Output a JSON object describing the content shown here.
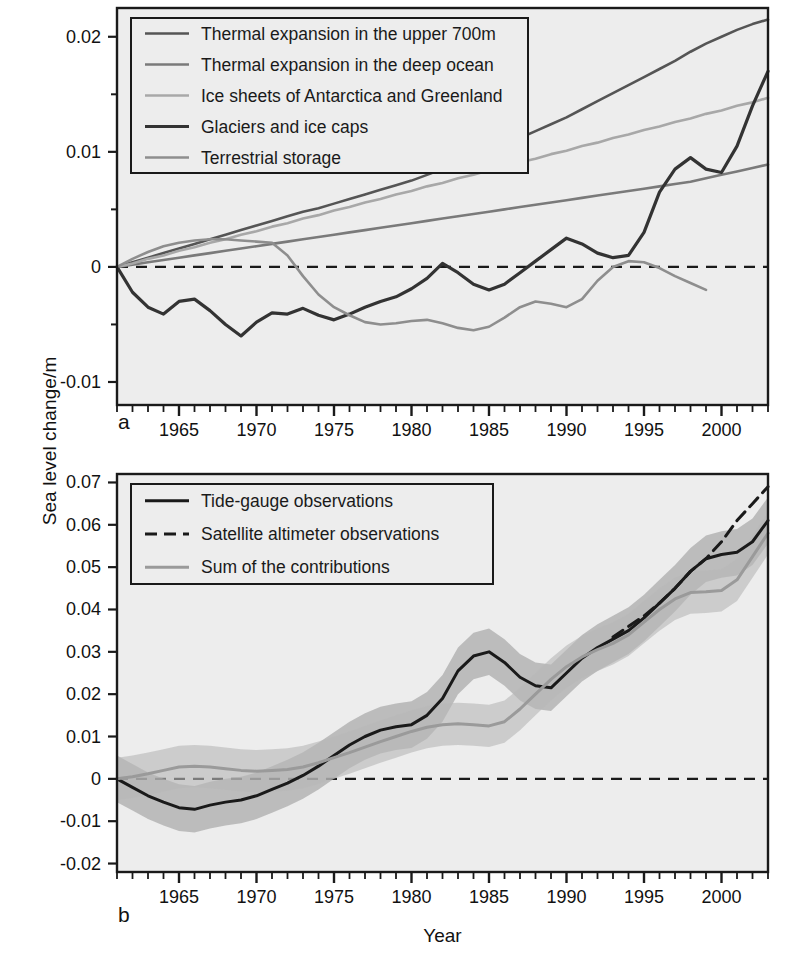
{
  "figure": {
    "axis_y_title": "Sea level change/m",
    "axis_x_title": "Year",
    "panel_a_label": "a",
    "panel_b_label": "b",
    "background": "#ededed",
    "frame_color": "#1a1a1a"
  },
  "panel_a": {
    "legend": [
      {
        "label": "Thermal expansion in the upper 700m",
        "color": "#555555",
        "dash": "none",
        "width": 2.6
      },
      {
        "label": "Thermal expansion in the deep ocean",
        "color": "#7a7a7a",
        "dash": "none",
        "width": 2.6
      },
      {
        "label": "Ice sheets of Antarctica and Greenland",
        "color": "#a8a8a8",
        "dash": "none",
        "width": 2.6
      },
      {
        "label": "Glaciers and ice caps",
        "color": "#333333",
        "dash": "none",
        "width": 3.2
      },
      {
        "label": "Terrestrial storage",
        "color": "#8e8e8e",
        "dash": "none",
        "width": 2.6
      }
    ],
    "yticks": [
      "0.02",
      "0.01",
      "0",
      "-0.01"
    ],
    "ytick_values": [
      0.02,
      0.01,
      0,
      -0.01
    ],
    "yminor_values": [
      0.015,
      0.005,
      -0.005
    ],
    "xticks": [
      "1965",
      "1970",
      "1975",
      "1980",
      "1985",
      "1990",
      "1995",
      "2000"
    ],
    "xtick_values": [
      1965,
      1970,
      1975,
      1980,
      1985,
      1990,
      1995,
      2000
    ],
    "zero_line": 0
  },
  "panel_b": {
    "legend": [
      {
        "label": "Tide-gauge observations",
        "color": "#1a1a1a",
        "dash": "none",
        "width": 3.0
      },
      {
        "label": "Satellite altimeter observations",
        "color": "#1a1a1a",
        "dash": "12,7",
        "width": 3.0
      },
      {
        "label": "Sum of the contributions",
        "color": "#9a9a9a",
        "dash": "none",
        "width": 3.0
      }
    ],
    "yticks": [
      "0.07",
      "0.06",
      "0.05",
      "0.04",
      "0.03",
      "0.02",
      "0.01",
      "0",
      "-0.01",
      "-0.02"
    ],
    "ytick_values": [
      0.07,
      0.06,
      0.05,
      0.04,
      0.03,
      0.02,
      0.01,
      0,
      -0.01,
      -0.02
    ],
    "xticks": [
      "1965",
      "1970",
      "1975",
      "1980",
      "1985",
      "1990",
      "1995",
      "2000"
    ],
    "xtick_values": [
      1965,
      1970,
      1975,
      1980,
      1985,
      1990,
      1995,
      2000
    ],
    "zero_line": 0
  },
  "chart_data": [
    {
      "type": "line",
      "panel": "a",
      "title": "",
      "xlabel": "Year",
      "ylabel": "Sea level change/m",
      "xlim": [
        1961,
        2003
      ],
      "ylim": [
        -0.012,
        0.0225
      ],
      "grid": false,
      "legend_position": "top-left",
      "x": [
        1961,
        1962,
        1963,
        1964,
        1965,
        1966,
        1967,
        1968,
        1969,
        1970,
        1971,
        1972,
        1973,
        1974,
        1975,
        1976,
        1977,
        1978,
        1979,
        1980,
        1981,
        1982,
        1983,
        1984,
        1985,
        1986,
        1987,
        1988,
        1989,
        1990,
        1991,
        1992,
        1993,
        1994,
        1995,
        1996,
        1997,
        1998,
        1999,
        2000,
        2001,
        2002,
        2003
      ],
      "series": [
        {
          "name": "Thermal expansion in the upper 700m",
          "color": "#555555",
          "values": [
            0.0,
            0.0004,
            0.0008,
            0.0012,
            0.0016,
            0.002,
            0.0024,
            0.0028,
            0.0032,
            0.0036,
            0.004,
            0.0044,
            0.0048,
            0.0051,
            0.0055,
            0.0059,
            0.0063,
            0.0067,
            0.0071,
            0.0075,
            0.008,
            0.0085,
            0.009,
            0.0095,
            0.01,
            0.0106,
            0.0112,
            0.0118,
            0.0124,
            0.013,
            0.0137,
            0.0144,
            0.0151,
            0.0158,
            0.0165,
            0.0172,
            0.0179,
            0.0187,
            0.0194,
            0.02,
            0.0206,
            0.0211,
            0.0215
          ]
        },
        {
          "name": "Thermal expansion in the deep ocean",
          "color": "#7a7a7a",
          "values": [
            0.0,
            0.0002,
            0.0004,
            0.0006,
            0.0008,
            0.001,
            0.0012,
            0.0014,
            0.0016,
            0.0018,
            0.002,
            0.0022,
            0.0024,
            0.0026,
            0.0028,
            0.003,
            0.0032,
            0.0034,
            0.0036,
            0.0038,
            0.004,
            0.0042,
            0.0044,
            0.0046,
            0.0048,
            0.005,
            0.0052,
            0.0054,
            0.0056,
            0.0058,
            0.006,
            0.0062,
            0.0064,
            0.0066,
            0.0068,
            0.007,
            0.0072,
            0.0074,
            0.0077,
            0.008,
            0.0083,
            0.0086,
            0.0089
          ]
        },
        {
          "name": "Ice sheets of Antarctica and Greenland",
          "color": "#a8a8a8",
          "values": [
            0.0,
            0.0003,
            0.0007,
            0.001,
            0.0014,
            0.0017,
            0.0021,
            0.0024,
            0.0028,
            0.0031,
            0.0035,
            0.0038,
            0.0042,
            0.0045,
            0.0049,
            0.0052,
            0.0056,
            0.0059,
            0.0063,
            0.0066,
            0.007,
            0.0073,
            0.0077,
            0.008,
            0.0084,
            0.0087,
            0.0091,
            0.0094,
            0.0098,
            0.0101,
            0.0105,
            0.0108,
            0.0112,
            0.0115,
            0.0119,
            0.0122,
            0.0126,
            0.0129,
            0.0133,
            0.0136,
            0.014,
            0.0143,
            0.0147
          ]
        },
        {
          "name": "Glaciers and ice caps",
          "color": "#333333",
          "values": [
            0.0,
            -0.0022,
            -0.0035,
            -0.0041,
            -0.003,
            -0.0028,
            -0.0038,
            -0.005,
            -0.006,
            -0.0048,
            -0.004,
            -0.0041,
            -0.0036,
            -0.0042,
            -0.0046,
            -0.0041,
            -0.0035,
            -0.003,
            -0.0026,
            -0.0019,
            -0.001,
            0.0003,
            -0.0005,
            -0.0015,
            -0.002,
            -0.0015,
            -0.0005,
            0.0005,
            0.0015,
            0.0025,
            0.002,
            0.0012,
            0.0008,
            0.001,
            0.003,
            0.0065,
            0.0085,
            0.0095,
            0.0085,
            0.0082,
            0.0105,
            0.014,
            0.017
          ]
        },
        {
          "name": "Terrestrial storage",
          "color": "#8e8e8e",
          "values": [
            0.0,
            0.0007,
            0.0013,
            0.0018,
            0.0021,
            0.0023,
            0.0024,
            0.0024,
            0.0023,
            0.0022,
            0.0021,
            0.001,
            -0.0008,
            -0.0024,
            -0.0035,
            -0.0042,
            -0.0048,
            -0.005,
            -0.0049,
            -0.0047,
            -0.0046,
            -0.0049,
            -0.0053,
            -0.0055,
            -0.0052,
            -0.0044,
            -0.0035,
            -0.003,
            -0.0032,
            -0.0035,
            -0.0028,
            -0.0012,
            0.0,
            0.0005,
            0.0004,
            -0.0001,
            -0.0008,
            -0.0014,
            -0.002,
            null,
            null,
            null,
            null
          ]
        }
      ]
    },
    {
      "type": "line",
      "panel": "b",
      "title": "",
      "xlabel": "Year",
      "ylabel": "Sea level change/m",
      "xlim": [
        1961,
        2003
      ],
      "ylim": [
        -0.022,
        0.072
      ],
      "grid": false,
      "legend_position": "top-left",
      "x": [
        1961,
        1962,
        1963,
        1964,
        1965,
        1966,
        1967,
        1968,
        1969,
        1970,
        1971,
        1972,
        1973,
        1974,
        1975,
        1976,
        1977,
        1978,
        1979,
        1980,
        1981,
        1982,
        1983,
        1984,
        1985,
        1986,
        1987,
        1988,
        1989,
        1990,
        1991,
        1992,
        1993,
        1994,
        1995,
        1996,
        1997,
        1998,
        1999,
        2000,
        2001,
        2002,
        2003
      ],
      "series": [
        {
          "name": "Tide-gauge observations",
          "color": "#1a1a1a",
          "band_color": "#9e9e9e",
          "band_half_width": 0.0055,
          "values": [
            0.0,
            -0.002,
            -0.004,
            -0.0055,
            -0.0068,
            -0.0072,
            -0.0062,
            -0.0055,
            -0.005,
            -0.004,
            -0.0025,
            -0.001,
            0.0008,
            0.003,
            0.0055,
            0.008,
            0.01,
            0.0115,
            0.0123,
            0.0128,
            0.015,
            0.019,
            0.0255,
            0.029,
            0.03,
            0.0275,
            0.024,
            0.022,
            0.0215,
            0.025,
            0.0285,
            0.031,
            0.033,
            0.035,
            0.038,
            0.0415,
            0.045,
            0.049,
            0.052,
            0.053,
            0.0535,
            0.056,
            0.061
          ]
        },
        {
          "name": "Sum of the contributions",
          "color": "#9a9a9a",
          "band_color": "#b8b8b8",
          "band_half_width": 0.005,
          "values": [
            0.0,
            0.0005,
            0.0012,
            0.002,
            0.0028,
            0.003,
            0.0028,
            0.0024,
            0.002,
            0.0018,
            0.002,
            0.0022,
            0.0028,
            0.0038,
            0.005,
            0.0062,
            0.0075,
            0.0088,
            0.01,
            0.0112,
            0.0122,
            0.0128,
            0.013,
            0.0128,
            0.0125,
            0.0135,
            0.0165,
            0.02,
            0.0235,
            0.0265,
            0.0288,
            0.0305,
            0.032,
            0.034,
            0.037,
            0.04,
            0.0425,
            0.044,
            0.0442,
            0.0445,
            0.047,
            0.0525,
            0.058
          ]
        },
        {
          "name": "Satellite altimeter observations",
          "color": "#1a1a1a",
          "dash": "12,7",
          "values": [
            null,
            null,
            null,
            null,
            null,
            null,
            null,
            null,
            null,
            null,
            null,
            null,
            null,
            null,
            null,
            null,
            null,
            null,
            null,
            null,
            null,
            null,
            null,
            null,
            null,
            null,
            null,
            null,
            null,
            null,
            null,
            null,
            0.0335,
            0.036,
            0.0385,
            0.0415,
            0.045,
            0.049,
            0.052,
            0.056,
            0.061,
            0.065,
            0.069
          ]
        }
      ]
    }
  ]
}
